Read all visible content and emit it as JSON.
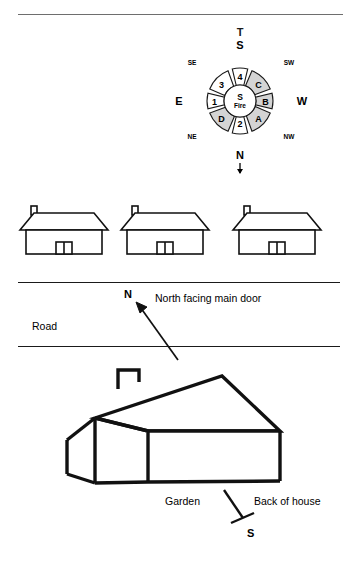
{
  "diagram": {
    "title_marker": "T",
    "compass": {
      "center_top": "S",
      "center_bottom": "Fire",
      "cardinals": {
        "top": "S",
        "bottom": "N",
        "left": "E",
        "right": "W"
      },
      "intercardinals": {
        "top_left": "SE",
        "top_right": "SW",
        "bottom_left": "NE",
        "bottom_right": "NW"
      },
      "segments": [
        {
          "label": "4",
          "shaded": false
        },
        {
          "label": "C",
          "shaded": true
        },
        {
          "label": "B",
          "shaded": true
        },
        {
          "label": "A",
          "shaded": true
        },
        {
          "label": "2",
          "shaded": false
        },
        {
          "label": "D",
          "shaded": true
        },
        {
          "label": "1",
          "shaded": false
        },
        {
          "label": "3",
          "shaded": false
        }
      ]
    },
    "houses_row": {
      "count": "3"
    },
    "street": {
      "road_label": "Road",
      "north_marker": "N",
      "door_caption": "North facing main door"
    },
    "plot": {
      "garden_label": "Garden",
      "back_label": "Back of house",
      "south_marker": "S"
    }
  },
  "colors": {
    "ink": "#000000",
    "rule": "#6e6e6e",
    "segment_shaded": "#d4d4d4",
    "segment_plain": "#ffffff"
  }
}
